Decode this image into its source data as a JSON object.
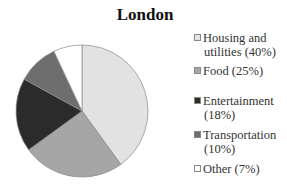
{
  "chart_data": {
    "type": "pie",
    "title": "London",
    "categories": [
      "Housing and utilities",
      "Food",
      "Entertainment",
      "Transportation",
      "Other"
    ],
    "values": [
      40,
      25,
      18,
      10,
      7
    ],
    "unit": "%",
    "colors": [
      "#e2e2e2",
      "#a6a6a6",
      "#2b2b2b",
      "#6e6e6e",
      "#ffffff"
    ],
    "start_angle": "12 o'clock",
    "direction": "clockwise",
    "legend_position": "right",
    "legend": [
      {
        "line1": "Housing and",
        "line2": "utilities (40%)"
      },
      {
        "line1": "Food (25%)",
        "line2": ""
      },
      {
        "line1": "Entertainment",
        "line2": "(18%)"
      },
      {
        "line1": "Transportation",
        "line2": "(10%)"
      },
      {
        "line1": "Other (7%)",
        "line2": ""
      }
    ]
  }
}
